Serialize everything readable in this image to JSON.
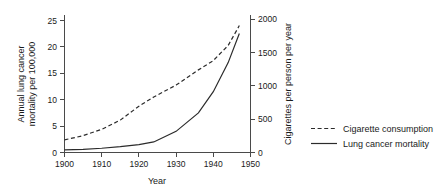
{
  "chart_data": {
    "type": "line",
    "title": "",
    "xlabel": "Year",
    "ylabel": "Annual lung cancer mortality per 100,000",
    "ylabel_line1": "Annual lung cancer",
    "ylabel_line2": "mortality per 100,000",
    "y2label": "Cigarettes per person per year",
    "xlim": [
      1897,
      1952
    ],
    "ylim": [
      0,
      26
    ],
    "y2lim": [
      0,
      2080
    ],
    "xticks": [
      1900,
      1910,
      1920,
      1930,
      1940,
      1950
    ],
    "xticklabels": [
      "1900",
      "1910",
      "1920",
      "1930",
      "1940",
      "1950"
    ],
    "yticks": [
      0,
      5,
      10,
      15,
      20,
      25
    ],
    "yticklabels": [
      "0",
      "5",
      "10",
      "15",
      "20",
      "25"
    ],
    "y2ticks": [
      0,
      500,
      1000,
      1500,
      2000
    ],
    "y2ticklabels": [
      "0",
      "500",
      "1000",
      "1500",
      "2000"
    ],
    "grid": false,
    "legend_position": "right-outside",
    "series": [
      {
        "name": "Cigarette consumption",
        "style": "dashed",
        "axis": "right",
        "color": "#2b2b2b",
        "x": [
          1900,
          1905,
          1910,
          1915,
          1920,
          1924,
          1930,
          1936,
          1940,
          1944,
          1947
        ],
        "values": [
          190,
          255,
          350,
          490,
          700,
          840,
          1020,
          1250,
          1390,
          1620,
          1920
        ]
      },
      {
        "name": "Lung cancer mortality",
        "style": "solid",
        "axis": "left",
        "color": "#2b2b2b",
        "x": [
          1900,
          1905,
          1910,
          1915,
          1920,
          1924,
          1930,
          1936,
          1940,
          1944,
          1947
        ],
        "values": [
          0.5,
          0.6,
          0.8,
          1.1,
          1.5,
          2.0,
          4.0,
          7.5,
          11.5,
          17.0,
          22.5
        ]
      }
    ]
  },
  "legend": {
    "items": [
      {
        "label": "Cigarette consumption",
        "style": "dashed"
      },
      {
        "label": "Lung cancer mortality",
        "style": "solid"
      }
    ]
  }
}
